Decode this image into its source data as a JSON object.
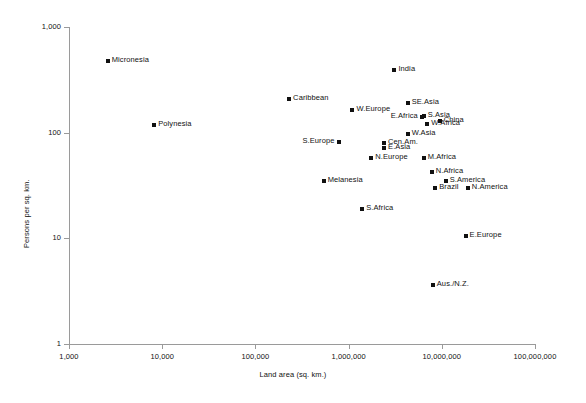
{
  "chart_data": {
    "type": "scatter",
    "title": "",
    "xlabel": "Land area (sq. km.)",
    "ylabel": "Persons per sq. km.",
    "xscale": "log",
    "yscale": "log",
    "xlim": [
      1000,
      100000000
    ],
    "ylim": [
      1,
      1000
    ],
    "grid": false,
    "legend": "none",
    "xticks": [
      "1,000",
      "10,000",
      "100,000",
      "1,000,000",
      "10,000,000",
      "100,000,000"
    ],
    "xtick_values": [
      1000,
      10000,
      100000,
      1000000,
      10000000,
      100000000
    ],
    "yticks": [
      "1",
      "10",
      "100",
      "1,000"
    ],
    "ytick_values": [
      1,
      10,
      100,
      1000
    ],
    "points": [
      {
        "label": "Micronesia",
        "x": 2600,
        "y": 480,
        "label_pos": "right"
      },
      {
        "label": "Polynesia",
        "x": 8200,
        "y": 118,
        "label_pos": "right"
      },
      {
        "label": "India",
        "x": 3100000,
        "y": 390,
        "label_pos": "right"
      },
      {
        "label": "Caribbean",
        "x": 230000,
        "y": 210,
        "label_pos": "right"
      },
      {
        "label": "W.Europe",
        "x": 1100000,
        "y": 165,
        "label_pos": "right"
      },
      {
        "label": "SE.Asia",
        "x": 4300000,
        "y": 190,
        "label_pos": "right"
      },
      {
        "label": "E.Africa",
        "x": 6100000,
        "y": 140,
        "label_pos": "left"
      },
      {
        "label": "S.Asia",
        "x": 6400000,
        "y": 145,
        "label_pos": "right"
      },
      {
        "label": "China",
        "x": 9500000,
        "y": 130,
        "label_pos": "right"
      },
      {
        "label": "W.Africa",
        "x": 7000000,
        "y": 122,
        "label_pos": "right"
      },
      {
        "label": "W.Asia",
        "x": 4300000,
        "y": 98,
        "label_pos": "right"
      },
      {
        "label": "S.Europe",
        "x": 780000,
        "y": 81,
        "label_pos": "left"
      },
      {
        "label": "Cen.Am.",
        "x": 2400000,
        "y": 80,
        "label_pos": "right"
      },
      {
        "label": "E.Asia",
        "x": 2400000,
        "y": 72,
        "label_pos": "right"
      },
      {
        "label": "N.Europe",
        "x": 1750000,
        "y": 57,
        "label_pos": "right"
      },
      {
        "label": "M.Africa",
        "x": 6400000,
        "y": 57,
        "label_pos": "right"
      },
      {
        "label": "N.Africa",
        "x": 7800000,
        "y": 42,
        "label_pos": "right"
      },
      {
        "label": "Melanesia",
        "x": 540000,
        "y": 35,
        "label_pos": "right"
      },
      {
        "label": "S.America",
        "x": 11000000,
        "y": 35,
        "label_pos": "right"
      },
      {
        "label": "Brazil",
        "x": 8500000,
        "y": 30,
        "label_pos": "right"
      },
      {
        "label": "N.America",
        "x": 19000000,
        "y": 30,
        "label_pos": "right"
      },
      {
        "label": "S.Africa",
        "x": 1400000,
        "y": 19,
        "label_pos": "right"
      },
      {
        "label": "E.Europe",
        "x": 18000000,
        "y": 10.5,
        "label_pos": "right"
      },
      {
        "label": "Aus./N.Z.",
        "x": 8000000,
        "y": 3.6,
        "label_pos": "right"
      }
    ]
  }
}
